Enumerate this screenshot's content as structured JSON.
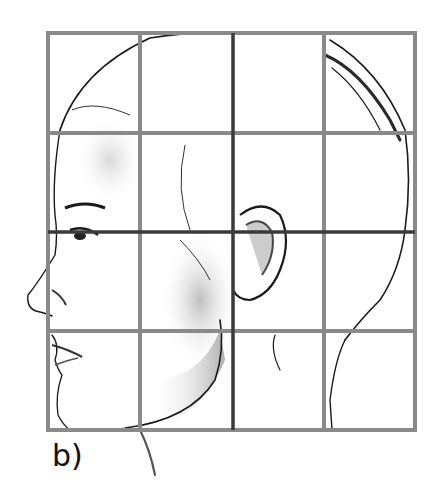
{
  "figure": {
    "panel_label": "b)",
    "grid": {
      "columns": 4,
      "rows": 4,
      "x_lines": [
        48,
        140,
        233,
        324,
        415
      ],
      "y_lines": [
        33,
        133,
        232,
        331,
        430
      ],
      "line_color": "#8a8a8a",
      "center_line_color": "#3a3a3a"
    },
    "colors": {
      "sketch_stroke": "#1a1a1a",
      "shade": "#b8b8b8",
      "background": "#ffffff"
    }
  }
}
